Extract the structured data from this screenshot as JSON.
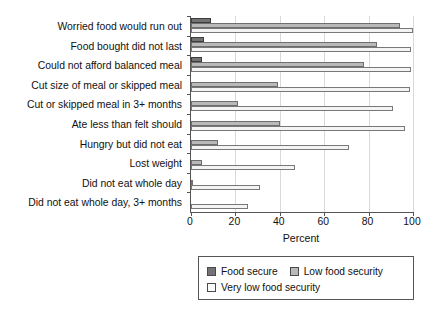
{
  "chart_data": {
    "type": "bar",
    "orientation": "horizontal",
    "title": "",
    "xlabel": "Percent",
    "ylabel": "",
    "xlim": [
      0,
      100
    ],
    "xticks": [
      0,
      20,
      40,
      60,
      80,
      100
    ],
    "grid": true,
    "legend_position": "bottom",
    "categories": [
      "Worried food would run out",
      "Food bought did not last",
      "Could not afford balanced meal",
      "Cut size of meal or skipped meal",
      "Cut or skipped meal in 3+ months",
      "Ate less than felt should",
      "Hungry but did not eat",
      "Lost weight",
      "Did not eat whole day",
      "Did not eat whole day, 3+ months"
    ],
    "series": [
      {
        "name": "Food secure",
        "color": "#737373",
        "values": [
          9,
          6,
          5,
          0,
          0,
          0,
          0,
          0,
          0,
          0
        ]
      },
      {
        "name": "Low food security",
        "color": "#b9b9b9",
        "values": [
          94,
          84,
          78,
          39,
          21,
          40,
          12,
          5,
          1,
          0
        ]
      },
      {
        "name": "Very low food security",
        "color": "#f4f4f4",
        "values": [
          100,
          99,
          99,
          98.6,
          91,
          96.5,
          71,
          47,
          31,
          25.5
        ]
      }
    ]
  },
  "axis": {
    "tick_labels": [
      "0",
      "20",
      "40",
      "60",
      "80",
      "100"
    ],
    "x_title": "Percent"
  },
  "legend": {
    "items": [
      {
        "label": "Food secure",
        "series": 0
      },
      {
        "label": "Low food security",
        "series": 1
      },
      {
        "label": "Very low food security",
        "series": 2
      }
    ]
  }
}
